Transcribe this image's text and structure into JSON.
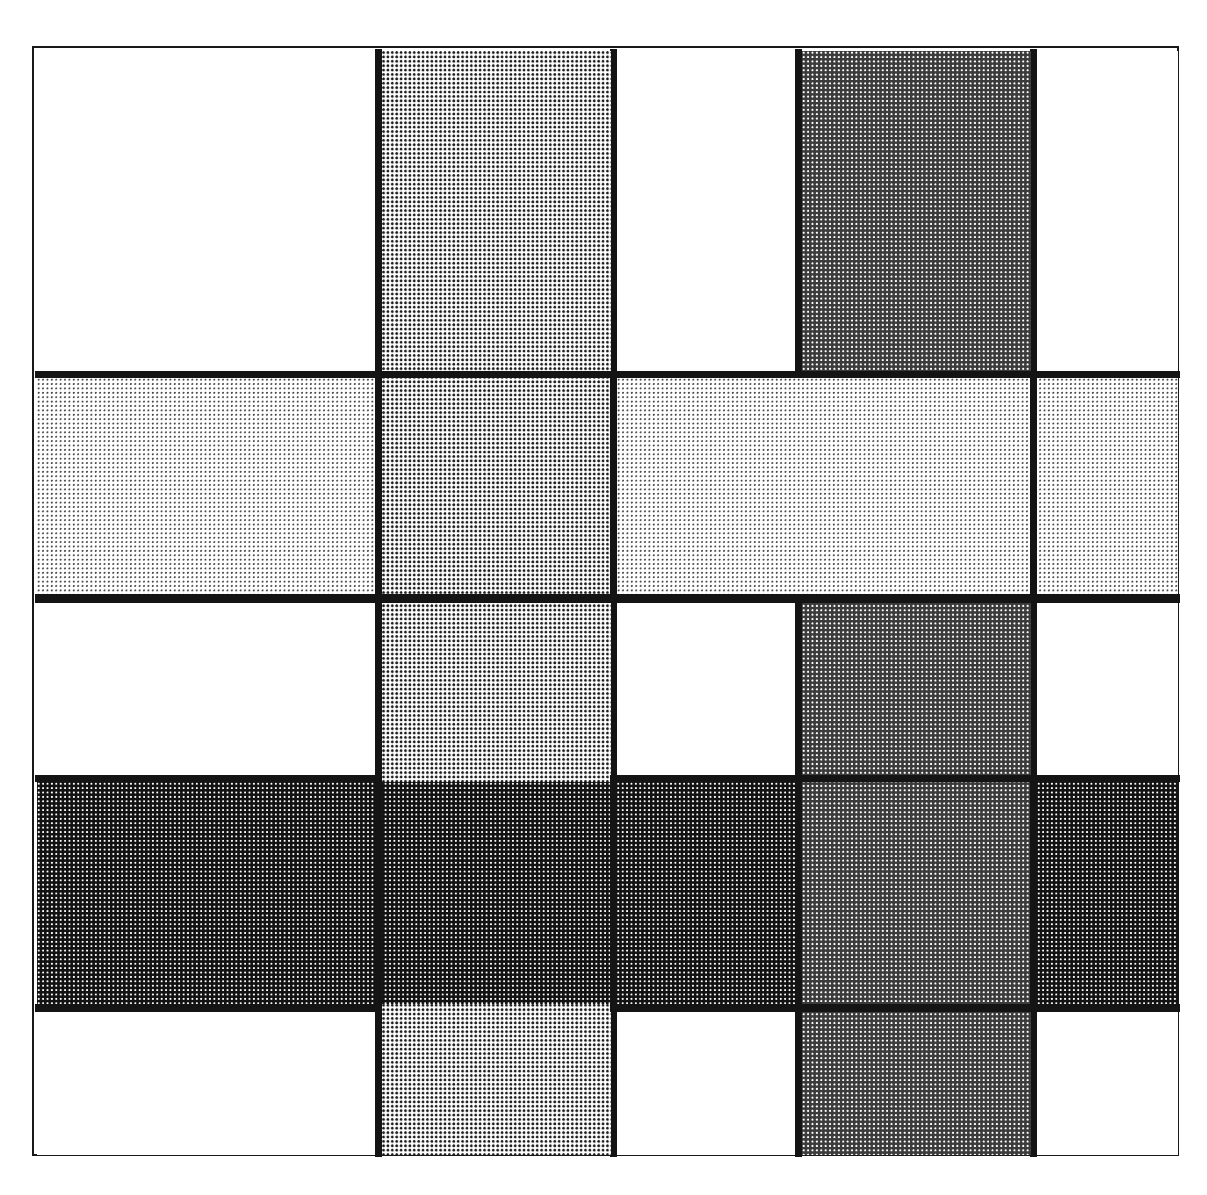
{
  "page": {
    "width": 1207,
    "height": 1195,
    "background": "#ffffff",
    "running_head": "· · · · · · · ·"
  },
  "figure": {
    "name": "interlocking-bands-plate",
    "plate": {
      "x": 32,
      "y": 46,
      "width": 1147,
      "height": 1110,
      "border_color": "#191919",
      "border_width": 2
    },
    "keyline_color": "#141414",
    "keyline_weight": 7,
    "tones": [
      {
        "key": "white",
        "label": "0%",
        "coverage": 0,
        "swatch": "#ffffff"
      },
      {
        "key": "vlight",
        "label": "12%",
        "coverage": 12,
        "swatch": "#e7e7e7"
      },
      {
        "key": "light",
        "label": "30%",
        "coverage": 30,
        "swatch": "#b4b4b4"
      },
      {
        "key": "dark",
        "label": "72%",
        "coverage": 72,
        "swatch": "#484848"
      },
      {
        "key": "vdark",
        "label": "88%",
        "coverage": 88,
        "swatch": "#1c1c1c"
      }
    ],
    "grid": {
      "columns": [
        33,
        378,
        613,
        798,
        1033,
        1178
      ],
      "rows": [
        47,
        373,
        595,
        777,
        1005,
        1155
      ],
      "column_labels": [
        "C1",
        "C2",
        "C3",
        "C4",
        "C5"
      ],
      "row_labels": [
        "R1",
        "R2",
        "R3",
        "R4",
        "R5"
      ]
    },
    "bands": [
      {
        "id": "band-v-light",
        "orientation": "vertical",
        "tone": "light",
        "span": "full-height",
        "column": "C2"
      },
      {
        "id": "band-v-dark",
        "orientation": "vertical",
        "tone": "dark",
        "span": "full-height",
        "column": "C4"
      },
      {
        "id": "band-h-vlight",
        "orientation": "horizontal",
        "tone": "vlight",
        "span": "full-width",
        "row": "R2"
      },
      {
        "id": "band-h-vdark",
        "orientation": "horizontal",
        "tone": "vdark",
        "span": "full-width",
        "row": "R4"
      }
    ],
    "tiles": [
      {
        "id": "t-r1c1",
        "row": 0,
        "col": 0,
        "x": 35,
        "y": 49,
        "w": 339,
        "h": 320,
        "tone": "white"
      },
      {
        "id": "t-r1c2",
        "row": 0,
        "col": 1,
        "x": 380,
        "y": 49,
        "w": 229,
        "h": 320,
        "tone": "light"
      },
      {
        "id": "t-r1c3",
        "row": 0,
        "col": 2,
        "x": 615,
        "y": 49,
        "w": 179,
        "h": 320,
        "tone": "white"
      },
      {
        "id": "t-r1c4",
        "row": 0,
        "col": 3,
        "x": 800,
        "y": 49,
        "w": 229,
        "h": 320,
        "tone": "dark"
      },
      {
        "id": "t-r1c5",
        "row": 0,
        "col": 4,
        "x": 1035,
        "y": 49,
        "w": 141,
        "h": 320,
        "tone": "white"
      },
      {
        "id": "t-r2c1",
        "row": 1,
        "col": 0,
        "x": 35,
        "y": 376,
        "w": 339,
        "h": 216,
        "tone": "vlight"
      },
      {
        "id": "t-r2c2",
        "row": 1,
        "col": 1,
        "x": 380,
        "y": 376,
        "w": 229,
        "h": 216,
        "tone": "light"
      },
      {
        "id": "t-r2c3",
        "row": 1,
        "col": 2,
        "x": 615,
        "y": 376,
        "w": 179,
        "h": 216,
        "tone": "vlight"
      },
      {
        "id": "t-r2c4",
        "row": 1,
        "col": 3,
        "x": 800,
        "y": 376,
        "w": 229,
        "h": 216,
        "tone": "vlight"
      },
      {
        "id": "t-r2c5",
        "row": 1,
        "col": 4,
        "x": 1035,
        "y": 376,
        "w": 141,
        "h": 216,
        "tone": "vlight"
      },
      {
        "id": "t-r3c1",
        "row": 2,
        "col": 0,
        "x": 35,
        "y": 601,
        "w": 339,
        "h": 172,
        "tone": "white"
      },
      {
        "id": "t-r3c2",
        "row": 2,
        "col": 1,
        "x": 380,
        "y": 601,
        "w": 229,
        "h": 172,
        "tone": "light"
      },
      {
        "id": "t-r3c3",
        "row": 2,
        "col": 2,
        "x": 615,
        "y": 601,
        "w": 179,
        "h": 172,
        "tone": "white"
      },
      {
        "id": "t-r3c4",
        "row": 2,
        "col": 3,
        "x": 800,
        "y": 601,
        "w": 229,
        "h": 172,
        "tone": "dark"
      },
      {
        "id": "t-r3c5",
        "row": 2,
        "col": 4,
        "x": 1035,
        "y": 601,
        "w": 141,
        "h": 172,
        "tone": "white"
      },
      {
        "id": "t-r4c1",
        "row": 3,
        "col": 0,
        "x": 35,
        "y": 780,
        "w": 339,
        "h": 222,
        "tone": "vdark"
      },
      {
        "id": "t-r4c2",
        "row": 3,
        "col": 1,
        "x": 380,
        "y": 780,
        "w": 229,
        "h": 222,
        "tone": "vdark"
      },
      {
        "id": "t-r4c3",
        "row": 3,
        "col": 2,
        "x": 615,
        "y": 780,
        "w": 179,
        "h": 222,
        "tone": "vdark"
      },
      {
        "id": "t-r4c4",
        "row": 3,
        "col": 3,
        "x": 800,
        "y": 780,
        "w": 229,
        "h": 222,
        "tone": "dark"
      },
      {
        "id": "t-r4c5",
        "row": 3,
        "col": 4,
        "x": 1035,
        "y": 780,
        "w": 141,
        "h": 222,
        "tone": "vdark"
      },
      {
        "id": "t-r5c1",
        "row": 4,
        "col": 0,
        "x": 35,
        "y": 1010,
        "w": 339,
        "h": 143,
        "tone": "white"
      },
      {
        "id": "t-r5c2",
        "row": 4,
        "col": 1,
        "x": 380,
        "y": 1010,
        "w": 229,
        "h": 143,
        "tone": "light"
      },
      {
        "id": "t-r5c3",
        "row": 4,
        "col": 2,
        "x": 615,
        "y": 1010,
        "w": 179,
        "h": 143,
        "tone": "white"
      },
      {
        "id": "t-r5c4",
        "row": 4,
        "col": 3,
        "x": 800,
        "y": 1010,
        "w": 229,
        "h": 143,
        "tone": "dark"
      },
      {
        "id": "t-r5c5",
        "row": 4,
        "col": 4,
        "x": 1035,
        "y": 1010,
        "w": 141,
        "h": 143,
        "tone": "white"
      }
    ],
    "keylines": [
      {
        "id": "k-h1",
        "orientation": "horizontal",
        "x": 33,
        "y": 369,
        "w": 1145,
        "h": 7
      },
      {
        "id": "k-h2",
        "orientation": "horizontal",
        "x": 33,
        "y": 592,
        "w": 1145,
        "h": 9
      },
      {
        "id": "k-h3",
        "orientation": "horizontal",
        "x": 33,
        "y": 773,
        "w": 1145,
        "h": 7
      },
      {
        "id": "k-h4",
        "orientation": "horizontal",
        "x": 33,
        "y": 1002,
        "w": 1145,
        "h": 8
      },
      {
        "id": "k-v1",
        "orientation": "vertical",
        "x": 373,
        "y": 47,
        "w": 7,
        "h": 1108
      },
      {
        "id": "k-v2",
        "orientation": "vertical",
        "x": 608,
        "y": 47,
        "w": 7,
        "h": 1108
      },
      {
        "id": "k-v3",
        "orientation": "vertical",
        "x": 793,
        "y": 47,
        "w": 7,
        "h": 1108
      },
      {
        "id": "k-v4",
        "orientation": "vertical",
        "x": 1028,
        "y": 47,
        "w": 7,
        "h": 1108
      }
    ]
  }
}
